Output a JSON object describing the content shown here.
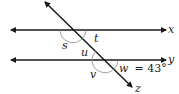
{
  "diagram": {
    "type": "parallel-lines-transversal",
    "lines": {
      "x": {
        "label": "x"
      },
      "y": {
        "label": "y"
      },
      "transversal": {
        "label": "z"
      }
    },
    "angles": {
      "s": {
        "label": "s"
      },
      "t": {
        "label": "t"
      },
      "u": {
        "label": "u"
      },
      "v": {
        "label": "v"
      },
      "w": {
        "label": "w",
        "value_text": "= 43°"
      }
    },
    "colors": {
      "line": "#1a1a1a",
      "arc": "#888888",
      "text": "#222222"
    }
  }
}
